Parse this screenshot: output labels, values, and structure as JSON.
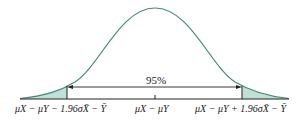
{
  "diagram": {
    "type": "normal-distribution-confidence-interval",
    "center_label": "μX − μY",
    "left_label": "μX − μY − 1.96σX̄ − Ȳ",
    "right_label": "μX − μY + 1.96σX̄ − Ȳ",
    "interval_label": "95%",
    "colors": {
      "curve": "#3f8c74",
      "tail_fill": "#bfe0d4",
      "lines": "#222222"
    }
  }
}
